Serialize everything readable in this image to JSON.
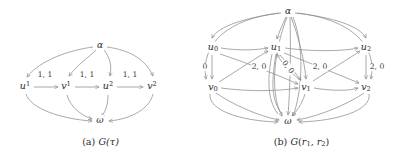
{
  "figure": {
    "background": "#ffffff",
    "stroke_color": "#8c8c8c",
    "text_color": "#2b2b2b"
  },
  "panel_a": {
    "caption_index": "(a)",
    "caption_fn": "G",
    "caption_arg": "(τ)",
    "nodes": [
      {
        "id": "alpha",
        "label": "α",
        "sup": "",
        "x": 100,
        "y": 45
      },
      {
        "id": "u1",
        "label": "u",
        "sup": "1",
        "x": 25,
        "y": 86
      },
      {
        "id": "v1",
        "label": "v",
        "sup": "1",
        "x": 66,
        "y": 86
      },
      {
        "id": "u2",
        "label": "u",
        "sup": "2",
        "x": 108,
        "y": 86
      },
      {
        "id": "v2",
        "label": "v",
        "sup": "2",
        "x": 152,
        "y": 86
      },
      {
        "id": "omega",
        "label": "ω",
        "sup": "",
        "x": 100,
        "y": 120
      }
    ],
    "edge_labels": [
      {
        "text": "1, 1",
        "x": 45,
        "y": 75
      },
      {
        "text": "1, 1",
        "x": 87,
        "y": 75
      },
      {
        "text": "1, 1",
        "x": 130,
        "y": 75
      }
    ],
    "edges": [
      {
        "from": "alpha",
        "to": "u1"
      },
      {
        "from": "alpha",
        "to": "v1"
      },
      {
        "from": "alpha",
        "to": "u2"
      },
      {
        "from": "alpha",
        "to": "v2"
      },
      {
        "from": "u1",
        "to": "v1"
      },
      {
        "from": "v1",
        "to": "u2"
      },
      {
        "from": "u2",
        "to": "v2"
      },
      {
        "from": "u1",
        "to": "omega"
      },
      {
        "from": "v1",
        "to": "omega"
      },
      {
        "from": "u2",
        "to": "omega"
      },
      {
        "from": "v2",
        "to": "omega"
      }
    ]
  },
  "panel_b": {
    "caption_index": "(b)",
    "caption_fn": "G",
    "caption_arg_open": "(",
    "caption_r1": "r",
    "caption_r1_sub": "1",
    "caption_sep": ", ",
    "caption_r2": "r",
    "caption_r2_sub": "2",
    "caption_arg_close": ")",
    "nodes": [
      {
        "id": "alpha",
        "label": "α",
        "sub": "",
        "x": 288,
        "y": 11
      },
      {
        "id": "u0",
        "label": "u",
        "sub": "0",
        "x": 213,
        "y": 47
      },
      {
        "id": "u1",
        "label": "u",
        "sub": "1",
        "x": 276,
        "y": 47
      },
      {
        "id": "u2",
        "label": "u",
        "sub": "2",
        "x": 366,
        "y": 47
      },
      {
        "id": "v0",
        "label": "v",
        "sub": "0",
        "x": 213,
        "y": 87
      },
      {
        "id": "v1",
        "label": "v",
        "sub": "1",
        "x": 306,
        "y": 87
      },
      {
        "id": "v2",
        "label": "v",
        "sub": "2",
        "x": 366,
        "y": 87
      },
      {
        "id": "omega",
        "label": "ω",
        "sub": "",
        "x": 288,
        "y": 121
      }
    ],
    "edge_labels": [
      {
        "text": "0",
        "x": 205,
        "y": 67,
        "rotated": false
      },
      {
        "text": "2, 0",
        "x": 259,
        "y": 67,
        "rotated": false
      },
      {
        "text": "0, 0",
        "x": 288,
        "y": 67,
        "rotated": true
      },
      {
        "text": "2, 0",
        "x": 320,
        "y": 67,
        "rotated": false
      },
      {
        "text": "2, 0",
        "x": 377,
        "y": 67,
        "rotated": false
      }
    ],
    "edges": [
      {
        "from": "alpha",
        "to": "u0"
      },
      {
        "from": "alpha",
        "to": "u1"
      },
      {
        "from": "alpha",
        "to": "u2"
      },
      {
        "from": "alpha",
        "to": "v0"
      },
      {
        "from": "alpha",
        "to": "v1"
      },
      {
        "from": "alpha",
        "to": "v2"
      },
      {
        "from": "u0",
        "to": "u1"
      },
      {
        "from": "u1",
        "to": "u2"
      },
      {
        "from": "u0",
        "to": "v0"
      },
      {
        "from": "u1",
        "to": "v1"
      },
      {
        "from": "u2",
        "to": "v2"
      },
      {
        "from": "v0",
        "to": "v1"
      },
      {
        "from": "v1",
        "to": "v2"
      },
      {
        "from": "u0",
        "to": "v1"
      },
      {
        "from": "v0",
        "to": "u1"
      },
      {
        "from": "u1",
        "to": "v2"
      },
      {
        "from": "v1",
        "to": "u2"
      },
      {
        "from": "u0",
        "to": "omega"
      },
      {
        "from": "u1",
        "to": "omega"
      },
      {
        "from": "u2",
        "to": "omega"
      },
      {
        "from": "v0",
        "to": "omega"
      },
      {
        "from": "v1",
        "to": "omega"
      },
      {
        "from": "v2",
        "to": "omega"
      }
    ]
  }
}
